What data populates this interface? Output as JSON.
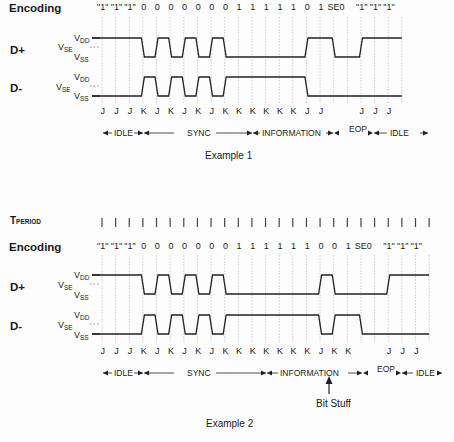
{
  "grid": {
    "x0": 102,
    "pitch": 13.63,
    "count": 25
  },
  "colors": {
    "line": "#222222",
    "grid": "#c8c8c8",
    "text": "#1a1a1a"
  },
  "example1": {
    "encoding_label": "Encoding",
    "encoding": [
      "\"1\"",
      "\"1\"",
      "\"1\"",
      "0",
      "0",
      "0",
      "0",
      "0",
      "0",
      "0",
      "1",
      "1",
      "1",
      "1",
      "1",
      "0",
      "1",
      "SE0",
      "",
      "\"1\"",
      "\"1\"",
      "\"1\""
    ],
    "dplus_label": "D+",
    "dminus_label": "D-",
    "vdd": "V",
    "vdd_sub": "DD",
    "vse": "V",
    "vse_sub": "SE",
    "vss": "V",
    "vss_sub": "SS",
    "states": [
      "J",
      "J",
      "J",
      "K",
      "J",
      "K",
      "J",
      "K",
      "J",
      "K",
      "K",
      "K",
      "K",
      "K",
      "K",
      "J",
      "J",
      "",
      "",
      "J",
      "J",
      "J"
    ],
    "segments": {
      "idle1": "IDLE",
      "sync": "SYNC",
      "information": "INFORMATION",
      "eop": "EOP",
      "idle2": "IDLE"
    },
    "caption": "Example 1"
  },
  "example2": {
    "tperiod_label": "T",
    "tperiod_sub": "PERIOD",
    "encoding_label": "Encoding",
    "encoding": [
      "\"1\"",
      "\"1\"",
      "\"1\"",
      "0",
      "0",
      "0",
      "0",
      "0",
      "0",
      "0",
      "1",
      "1",
      "1",
      "1",
      "1",
      "1",
      "0",
      "0",
      "1",
      "SE0",
      "",
      "\"1\"",
      "\"1\"",
      "\"1\""
    ],
    "dplus_label": "D+",
    "dminus_label": "D-",
    "vdd": "V",
    "vdd_sub": "DD",
    "vse": "V",
    "vse_sub": "SE",
    "vss": "V",
    "vss_sub": "SS",
    "states": [
      "J",
      "J",
      "J",
      "K",
      "J",
      "K",
      "J",
      "K",
      "J",
      "K",
      "K",
      "K",
      "K",
      "K",
      "K",
      "K",
      "J",
      "K",
      "K",
      "",
      "",
      "J",
      "J",
      "J"
    ],
    "segments": {
      "idle1": "IDLE",
      "sync": "SYNC",
      "information": "INFORMATION",
      "eop": "EOP",
      "idle2": "IDLE"
    },
    "annotation": "Bit Stuff",
    "caption": "Example 2"
  }
}
